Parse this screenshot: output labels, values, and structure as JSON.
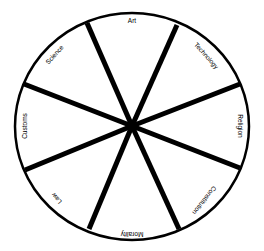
{
  "diagram": {
    "type": "wheel",
    "center": [
      132,
      126
    ],
    "radius_x": 117,
    "radius_y": 113,
    "stroke_color": "#000000",
    "background": "#ffffff",
    "segments": [
      {
        "label": "Art",
        "x": 132,
        "y": 21,
        "rotate": 0
      },
      {
        "label": "Technology",
        "x": 206,
        "y": 56,
        "rotate": 48
      },
      {
        "label": "Religion",
        "x": 240,
        "y": 126,
        "rotate": 90
      },
      {
        "label": "Constitution",
        "x": 204,
        "y": 200,
        "rotate": 128
      },
      {
        "label": "Morality",
        "x": 132,
        "y": 234,
        "rotate": 180
      },
      {
        "label": "Law",
        "x": 57,
        "y": 198,
        "rotate": 230
      },
      {
        "label": "Customs",
        "x": 25,
        "y": 126,
        "rotate": 270
      },
      {
        "label": "Science",
        "x": 55,
        "y": 55,
        "rotate": 312
      }
    ],
    "spokes": [
      [
        87,
        23
      ],
      [
        177,
        25
      ],
      [
        240,
        84
      ],
      [
        240,
        168
      ],
      [
        179,
        229
      ],
      [
        89,
        229
      ],
      [
        25,
        170
      ],
      [
        24,
        84
      ]
    ]
  }
}
